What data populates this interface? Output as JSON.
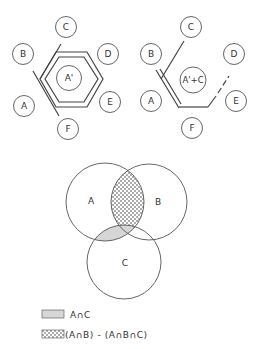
{
  "colors": {
    "stroke": "#555555",
    "line": "#444444",
    "shade": "#d6d6d6",
    "dots": "#333333",
    "background": "#ffffff"
  },
  "left_diagram": {
    "nodes": {
      "A": "A",
      "B": "B",
      "C": "C",
      "D": "D",
      "E": "E",
      "F": "F"
    },
    "center_label": "A'"
  },
  "right_diagram": {
    "nodes": {
      "A": "A",
      "B": "B",
      "C": "C",
      "D": "D",
      "E": "E",
      "F": "F"
    },
    "center_label": "A'+C"
  },
  "venn": {
    "sets": [
      {
        "label": "A"
      },
      {
        "label": "B"
      },
      {
        "label": "C"
      }
    ]
  },
  "legend": {
    "items": [
      {
        "pattern": "gray-shade",
        "label": "A∩C"
      },
      {
        "pattern": "dotted",
        "label": "(A∩B) - (A∩B∩C)"
      }
    ]
  }
}
